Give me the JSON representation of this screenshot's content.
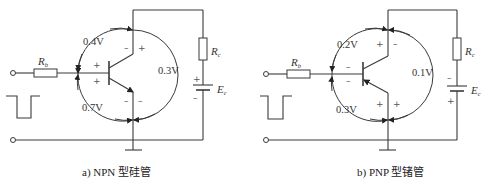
{
  "diagrams": [
    {
      "id": "npn",
      "caption": "a) NPN 型硅管",
      "transistor_type": "NPN",
      "material": "silicon",
      "voltages": {
        "be_label": "0.7V",
        "cb_label": "0.4V",
        "ce_label": "0.3V"
      },
      "components": {
        "rb": {
          "symbol": "R",
          "subscript": "b"
        },
        "rc": {
          "symbol": "R",
          "subscript": "c"
        },
        "ec": {
          "symbol": "E",
          "subscript": "c"
        }
      },
      "signs": {
        "base_upper": "+",
        "base_lower": "+",
        "collector_left": "–",
        "collector_right": "+",
        "emitter_left": "–",
        "emitter_right": "–",
        "battery_top": "+",
        "battery_bottom": "–"
      }
    },
    {
      "id": "pnp",
      "caption": "b) PNP 型锗管",
      "transistor_type": "PNP",
      "material": "germanium",
      "voltages": {
        "be_label": "0.3V",
        "cb_label": "0.2V",
        "ce_label": "0.1V"
      },
      "components": {
        "rb": {
          "symbol": "R",
          "subscript": "b"
        },
        "rc": {
          "symbol": "R",
          "subscript": "c"
        },
        "ec": {
          "symbol": "E",
          "subscript": "c"
        }
      },
      "signs": {
        "base_upper": "–",
        "base_lower": "–",
        "collector_left": "+",
        "collector_right": "–",
        "emitter_left": "+",
        "emitter_right": "+",
        "battery_top": "–",
        "battery_bottom": "+"
      }
    }
  ]
}
